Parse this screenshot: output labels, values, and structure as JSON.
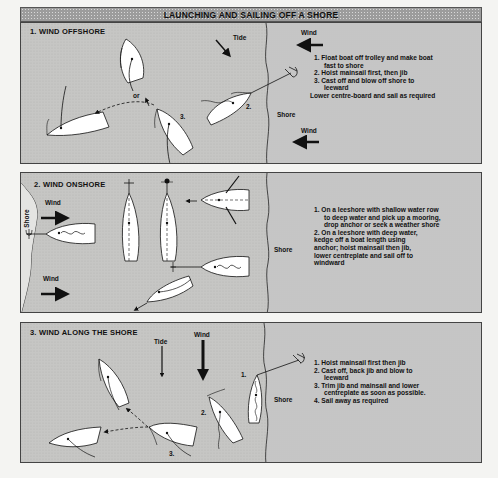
{
  "title": "LAUNCHING AND SAILING OFF A SHORE",
  "colors": {
    "water": "#c4c4c2",
    "shore": "#e4e4e2",
    "boat_fill": "#ffffff",
    "ink": "#111111",
    "title_bar": "#9c9c9c"
  },
  "panels": [
    {
      "heading": "1. WIND OFFSHORE",
      "labels": {
        "tide": "Tide",
        "wind_top": "Wind",
        "wind_bottom": "Wind",
        "shore": "Shore",
        "or": "or",
        "boat2": "2.",
        "boat3": "3."
      },
      "steps": [
        "1.  Float boat off trolley and make boat",
        "     fast to shore",
        "2.  Hoist mainsail first, then jib",
        "3.  Cast off and blow off shore to",
        "     leeward",
        "Lower centre-board and sail as required"
      ]
    },
    {
      "heading": "2. WIND ONSHORE",
      "labels": {
        "shore_left": "Shore",
        "wind_top": "Wind",
        "wind_bottom": "Wind",
        "shore_right": "Shore"
      },
      "steps": [
        "1.  On a leeshore with shallow water row",
        "     to deep water and pick up a mooring,",
        "     drop anchor or seek a weather shore",
        "2.  On a leeshore with deep water,",
        "kedge off a boat length using",
        "anchor; hoist mainsail then jib,",
        "lower centreplate and sail off to",
        "windward"
      ]
    },
    {
      "heading": "3. WIND ALONG THE SHORE",
      "labels": {
        "tide": "Tide",
        "wind": "Wind",
        "shore": "Shore",
        "boat1": "1.",
        "boat2": "2.",
        "boat3": "3."
      },
      "steps": [
        "1.  Hoist mainsail first then jib",
        "2.  Cast off, back jib and blow to",
        "     leeward",
        "3.  Trim jib and mainsail and lower",
        "     centreplate as soon as possible.",
        "4.  Sail away as required"
      ]
    }
  ]
}
